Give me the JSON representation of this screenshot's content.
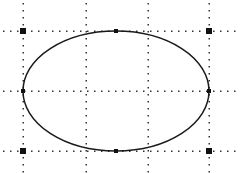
{
  "canvas": {
    "width": 240,
    "height": 173,
    "background": "#ffffff"
  },
  "colors": {
    "stroke": "#1a1a1a",
    "grid_dot": "#333333",
    "handle": "#111111"
  },
  "grid": {
    "vertical_lines_x": [
      23,
      86,
      148,
      209
    ],
    "horizontal_lines_y": [
      31,
      91,
      151
    ],
    "dot_spacing": 7
  },
  "ellipse": {
    "cx": 116,
    "cy": 91,
    "rx": 93,
    "ry": 60
  },
  "selection_handles": [
    {
      "name": "top-left",
      "x": 23,
      "y": 31,
      "size": 6
    },
    {
      "name": "top-mid",
      "x": 116,
      "y": 31,
      "size": 4
    },
    {
      "name": "top-right",
      "x": 209,
      "y": 31,
      "size": 6
    },
    {
      "name": "mid-left",
      "x": 23,
      "y": 91,
      "size": 4
    },
    {
      "name": "mid-right",
      "x": 209,
      "y": 91,
      "size": 4
    },
    {
      "name": "bottom-left",
      "x": 23,
      "y": 151,
      "size": 6
    },
    {
      "name": "bottom-mid",
      "x": 116,
      "y": 151,
      "size": 4
    },
    {
      "name": "bottom-right",
      "x": 209,
      "y": 151,
      "size": 6
    }
  ]
}
